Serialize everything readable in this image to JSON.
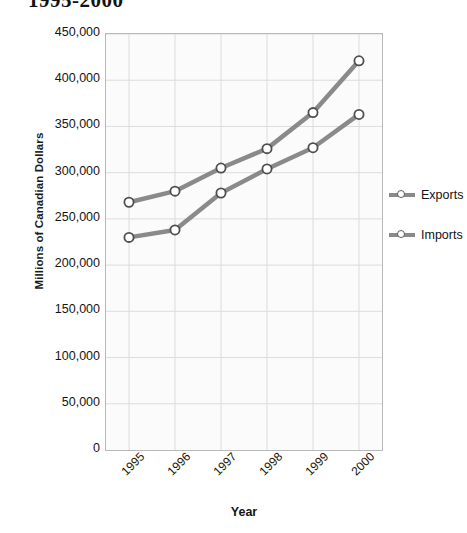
{
  "chart_data": {
    "type": "line",
    "title": "1995-2000",
    "xlabel": "Year",
    "ylabel": "Millions of Canadian Dollars",
    "categories": [
      "1995",
      "1996",
      "1997",
      "1998",
      "1999",
      "2000"
    ],
    "series": [
      {
        "name": "Exports",
        "values": [
          268000,
          280000,
          305000,
          326000,
          365000,
          421000
        ]
      },
      {
        "name": "Imports",
        "values": [
          230000,
          238000,
          278000,
          304000,
          327000,
          363000
        ]
      }
    ],
    "ylim": [
      0,
      450000
    ],
    "ytick_labels": [
      "450,000",
      "400,000",
      "350,000",
      "300,000",
      "250,000",
      "200,000",
      "150,000",
      "100,000",
      "50,000",
      "0"
    ],
    "ytick_values": [
      450000,
      400000,
      350000,
      300000,
      250000,
      200000,
      150000,
      100000,
      50000,
      0
    ],
    "grid": true,
    "legend_position": "right",
    "colors": {
      "line": "#8a8a8a",
      "marker_fill": "#ffffff",
      "marker_stroke": "#4f4f4f",
      "grid": "#dcdcdc",
      "plot_background": "#fbfbfb",
      "plot_border": "#b9b9b9",
      "text": "#141414"
    }
  }
}
